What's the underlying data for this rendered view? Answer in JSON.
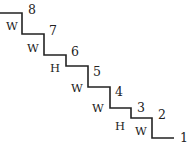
{
  "diagram": {
    "type": "staircase",
    "stroke_color": "#222222",
    "path_points": [
      [
        0,
        13
      ],
      [
        22,
        13
      ],
      [
        22,
        34
      ],
      [
        44,
        34
      ],
      [
        44,
        55
      ],
      [
        66,
        55
      ],
      [
        66,
        66
      ],
      [
        88,
        66
      ],
      [
        88,
        87
      ],
      [
        110,
        87
      ],
      [
        110,
        108
      ],
      [
        131,
        108
      ],
      [
        131,
        118
      ],
      [
        152,
        118
      ],
      [
        152,
        138
      ],
      [
        174,
        138
      ]
    ],
    "numbers": [
      {
        "text": "8",
        "x": 32,
        "y": 10
      },
      {
        "text": "7",
        "x": 53,
        "y": 31
      },
      {
        "text": "6",
        "x": 75,
        "y": 52
      },
      {
        "text": "5",
        "x": 97,
        "y": 72
      },
      {
        "text": "4",
        "x": 119,
        "y": 92
      },
      {
        "text": "3",
        "x": 141,
        "y": 108
      },
      {
        "text": "2",
        "x": 162,
        "y": 115
      },
      {
        "text": "1",
        "x": 184,
        "y": 138
      }
    ],
    "step_labels": [
      {
        "text": "W",
        "x": 12,
        "y": 26
      },
      {
        "text": "W",
        "x": 33,
        "y": 48
      },
      {
        "text": "H",
        "x": 55,
        "y": 68
      },
      {
        "text": "W",
        "x": 77,
        "y": 88
      },
      {
        "text": "W",
        "x": 98,
        "y": 108
      },
      {
        "text": "H",
        "x": 120,
        "y": 126
      },
      {
        "text": "W",
        "x": 141,
        "y": 131
      }
    ]
  }
}
